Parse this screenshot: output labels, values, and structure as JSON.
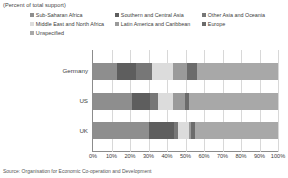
{
  "subtitle": "(Percent of total support)",
  "source_note": "Source: Organisation for Economic Co-operation and Development",
  "legend": [
    {
      "label": "Sub-Saharan Africa",
      "color": "#8e8e8e",
      "col": 0,
      "row": 0
    },
    {
      "label": "Southern and Central Asia",
      "color": "#5e5e5e",
      "col": 1,
      "row": 0
    },
    {
      "label": "Other Asia and Oceania",
      "color": "#777777",
      "col": 2,
      "row": 0
    },
    {
      "label": "Middle East and North Africa",
      "color": "#dcdcdc",
      "col": 0,
      "row": 1
    },
    {
      "label": "Latin America and Caribbean",
      "color": "#9a9a9a",
      "col": 1,
      "row": 1
    },
    {
      "label": "Europe",
      "color": "#6b6b6b",
      "col": 2,
      "row": 1
    },
    {
      "label": "Unspecified",
      "color": "#a8a8a8",
      "col": 0,
      "row": 2
    }
  ],
  "xticks": [
    "0%",
    "10%",
    "20%",
    "30%",
    "40%",
    "50%",
    "60%",
    "70%",
    "80%",
    "90%",
    "100%"
  ],
  "chart_data": {
    "type": "bar",
    "orientation": "horizontal",
    "stacked": true,
    "normalized": true,
    "title": "",
    "subtitle": "(Percent of total support)",
    "xlabel": "",
    "ylabel": "",
    "xlim": [
      0,
      100
    ],
    "grid": true,
    "legend_position": "top",
    "categories": [
      "Germany",
      "US",
      "UK"
    ],
    "series": [
      {
        "name": "Sub-Saharan Africa",
        "color": "#8e8e8e",
        "values": [
          13,
          21,
          30
        ]
      },
      {
        "name": "Southern and Central Asia",
        "color": "#5e5e5e",
        "values": [
          10,
          10,
          14
        ]
      },
      {
        "name": "Other Asia and Oceania",
        "color": "#777777",
        "values": [
          9,
          4,
          2
        ]
      },
      {
        "name": "Middle East and North Africa",
        "color": "#dcdcdc",
        "values": [
          11,
          8,
          6
        ]
      },
      {
        "name": "Latin America and Caribbean",
        "color": "#9a9a9a",
        "values": [
          8,
          7,
          1
        ]
      },
      {
        "name": "Europe",
        "color": "#6b6b6b",
        "values": [
          5,
          2,
          2
        ]
      },
      {
        "name": "Unspecified",
        "color": "#a8a8a8",
        "values": [
          44,
          48,
          45
        ]
      }
    ]
  }
}
